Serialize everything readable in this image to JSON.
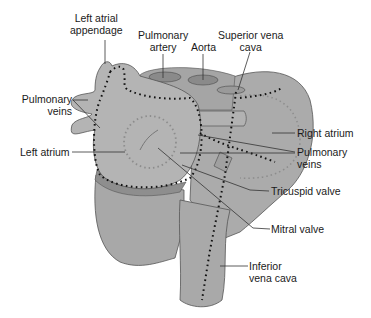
{
  "figure": {
    "colors": {
      "tissue": "#aaaaaa",
      "tissue_light": "#b7b7b7",
      "tissue_dark": "#8e8e8e",
      "outline": "#555555",
      "dots": "#111111",
      "dots_light": "#8a8a8a",
      "leader": "#333333"
    }
  },
  "labels": {
    "left_atrial_appendage": [
      "Left atrial",
      "appendage"
    ],
    "pulmonary_artery": [
      "Pulmonary",
      "artery"
    ],
    "aorta": "Aorta",
    "superior_vena_cava": [
      "Superior vena",
      "cava"
    ],
    "pulmonary_veins_left": [
      "Pulmonary",
      "veins"
    ],
    "right_atrium": "Right atrium",
    "left_atrium": "Left atrium",
    "pulmonary_veins_right": [
      "Pulmonary",
      "veins"
    ],
    "tricuspid_valve": "Tricuspid valve",
    "mitral_valve": "Mitral valve",
    "inferior_vena_cava": [
      "Inferior",
      "vena cava"
    ]
  }
}
